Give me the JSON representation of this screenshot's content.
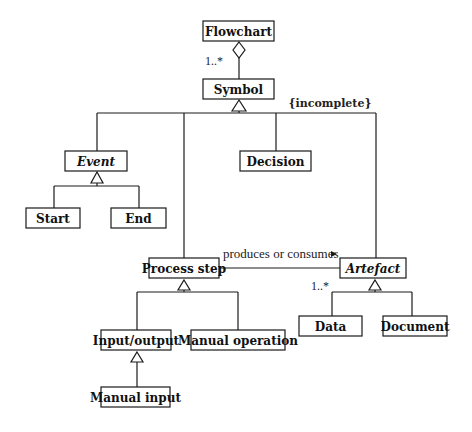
{
  "diagram": {
    "type": "UML class diagram",
    "classes": {
      "flowchart": {
        "label": "Flowchart",
        "abstract": false
      },
      "symbol": {
        "label": "Symbol",
        "abstract": false
      },
      "event": {
        "label": "Event",
        "abstract": true
      },
      "decision": {
        "label": "Decision",
        "abstract": false
      },
      "start": {
        "label": "Start",
        "abstract": false
      },
      "end": {
        "label": "End",
        "abstract": false
      },
      "process_step": {
        "label": "Process step",
        "abstract": false
      },
      "artefact": {
        "label": "Artefact",
        "abstract": true
      },
      "input_output": {
        "label": "Input/output",
        "abstract": false
      },
      "manual_operation": {
        "label": "Manual operation",
        "abstract": false
      },
      "manual_input": {
        "label": "Manual input",
        "abstract": false
      },
      "data": {
        "label": "Data",
        "abstract": false
      },
      "document": {
        "label": "Document",
        "abstract": false
      }
    },
    "relationships": {
      "aggregation": {
        "whole": "Flowchart",
        "part": "Symbol",
        "multiplicity": "1..*"
      },
      "symbol_generalization": {
        "parent": "Symbol",
        "children": [
          "Event",
          "Process step",
          "Decision",
          "Artefact"
        ],
        "constraint": "{incomplete}"
      },
      "event_generalization": {
        "parent": "Event",
        "children": [
          "Start",
          "End"
        ]
      },
      "process_generalization": {
        "parent": "Process step",
        "children": [
          "Input/output",
          "Manual operation"
        ]
      },
      "io_generalization": {
        "parent": "Input/output",
        "children": [
          "Manual input"
        ]
      },
      "artefact_generalization": {
        "parent": "Artefact",
        "children": [
          "Data",
          "Document"
        ]
      },
      "association": {
        "from": "Process step",
        "to": "Artefact",
        "label": "produces or consumes",
        "direction_marker": "▸",
        "multiplicity": "1..*"
      }
    },
    "colors": {
      "line": "#1a1a1a",
      "text": "#111111",
      "background": "#ffffff"
    }
  }
}
